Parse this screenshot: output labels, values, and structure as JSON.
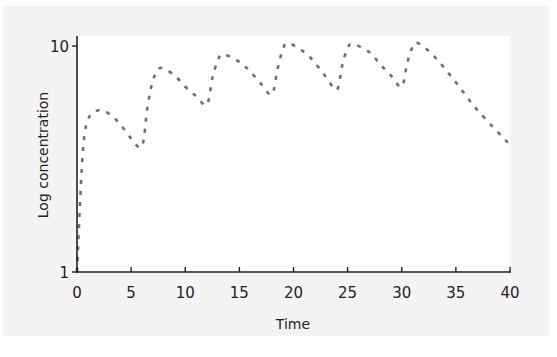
{
  "chart_data": {
    "type": "line",
    "title": "",
    "xlabel": "Time",
    "ylabel": "Log concentration",
    "xlim": [
      0,
      40
    ],
    "ylim": [
      1,
      10
    ],
    "yscale": "log",
    "x_ticks": [
      "0",
      "5",
      "10",
      "15",
      "20",
      "25",
      "30",
      "35",
      "40"
    ],
    "y_ticks": [
      "1",
      "10"
    ],
    "grid": false,
    "legend": null,
    "series": [
      {
        "name": "concentration",
        "style": "dashed",
        "color": "#707070",
        "x": [
          0,
          0.5,
          1,
          2,
          3,
          4,
          5,
          6,
          6.5,
          7,
          7.7,
          9,
          10,
          11,
          12,
          12.5,
          13,
          13.5,
          15,
          16,
          17,
          18,
          18.5,
          19,
          19.5,
          21,
          22,
          23,
          24,
          24.5,
          25,
          25.5,
          27,
          28,
          29,
          30,
          30.5,
          31,
          31.5,
          33,
          35,
          37,
          40
        ],
        "values": [
          1,
          3.2,
          4.7,
          5.2,
          5.0,
          4.5,
          3.9,
          3.6,
          5.3,
          7.0,
          8.0,
          7.4,
          6.6,
          6.0,
          5.5,
          7.2,
          8.6,
          9.2,
          8.5,
          7.7,
          6.8,
          6.1,
          7.8,
          9.6,
          10.3,
          9.4,
          8.4,
          7.3,
          6.4,
          8.2,
          9.8,
          10.2,
          9.4,
          8.3,
          7.4,
          6.6,
          8.4,
          9.9,
          10.3,
          9.0,
          6.9,
          5.2,
          3.65
        ]
      }
    ]
  }
}
